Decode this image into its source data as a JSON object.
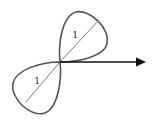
{
  "diagram": {
    "type": "polar-rose-two-petals",
    "labels": {
      "upper_petal_diameter": "1",
      "lower_petal_diameter": "1"
    },
    "axis": {
      "direction": "right",
      "name": "polar-axis"
    },
    "colors": {
      "curve": "#555555",
      "axis": "#111111",
      "background": "#ffffff"
    }
  }
}
